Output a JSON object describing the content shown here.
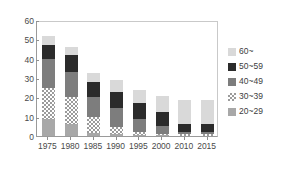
{
  "chart_data": {
    "type": "bar",
    "subtype": "stacked",
    "title": "",
    "subtitle": "",
    "xlabel": "",
    "ylabel": "",
    "categories": [
      "1975",
      "1980",
      "1985",
      "1990",
      "1995",
      "2000",
      "2010",
      "2015"
    ],
    "ylim": [
      0,
      60
    ],
    "yticks": [
      0,
      10,
      20,
      30,
      40,
      50,
      60
    ],
    "ytick_labels": [
      "0",
      "10",
      "20",
      "30",
      "40",
      "50",
      "60"
    ],
    "grid": false,
    "legend_position": "right",
    "series": [
      {
        "name": "20~29",
        "color": "#a8a8a8",
        "pattern": "solid",
        "values": [
          9.0,
          6.0,
          1.5,
          0.8,
          0.5,
          0.3,
          0.0,
          0.0
        ]
      },
      {
        "name": "30~39",
        "color": "#9b9b9b",
        "pattern": "checker",
        "values": [
          16.0,
          14.0,
          8.5,
          4.0,
          1.5,
          0.7,
          0.8,
          1.0
        ]
      },
      {
        "name": "40~49",
        "color": "#7d7d7d",
        "pattern": "solid",
        "values": [
          15.0,
          13.0,
          10.0,
          9.5,
          7.0,
          4.0,
          1.5,
          1.0
        ]
      },
      {
        "name": "50~59",
        "color": "#2b2b2b",
        "pattern": "solid",
        "values": [
          7.0,
          9.0,
          8.0,
          8.7,
          8.0,
          7.5,
          4.0,
          4.0
        ]
      },
      {
        "name": "60~",
        "color": "#d9d9d9",
        "pattern": "solid",
        "values": [
          4.5,
          4.0,
          4.5,
          6.0,
          7.0,
          8.0,
          12.5,
          12.5
        ]
      }
    ],
    "totals": [
      51.5,
      46.0,
      32.5,
      29.0,
      24.0,
      20.5,
      18.8,
      18.5
    ]
  },
  "legend": {
    "items": [
      {
        "label": "60~",
        "series": "60~",
        "swatch": "fill-60"
      },
      {
        "label": "50~59",
        "series": "50~59",
        "swatch": "fill-50"
      },
      {
        "label": "40~49",
        "series": "40~49",
        "swatch": "fill-40"
      },
      {
        "label": "30~39",
        "series": "30~39",
        "swatch": "fill-30"
      },
      {
        "label": "20~29",
        "series": "20~29",
        "swatch": "fill-20"
      }
    ]
  },
  "colors": {
    "axis": "#9a9a9a",
    "text": "#4a4a4a",
    "background": "#ffffff"
  }
}
